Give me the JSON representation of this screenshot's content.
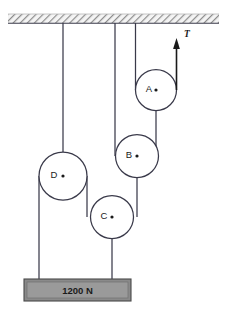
{
  "figure": {
    "type": "pulley-system-diagram",
    "background_color": "#ffffff",
    "line_color": "#3a3a4a",
    "label_color": "#1a1a1a"
  },
  "ceiling": {
    "name": "ceiling-support",
    "hatch_color": "#8d8d8d",
    "fill_color": "#f2f2f2",
    "x": 8,
    "y": 14,
    "width": 211,
    "height": 9
  },
  "pulleys": [
    {
      "id": "A",
      "label": "A",
      "cx": 156,
      "cy": 90,
      "r": 20.5,
      "label_dx": -7,
      "label_dy": -1,
      "fill": "#ffffff",
      "stroke": "#3a3a4a"
    },
    {
      "id": "B",
      "label": "B",
      "cx": 137,
      "cy": 156,
      "r": 21.5,
      "label_dx": -8,
      "label_dy": -1,
      "fill": "#ffffff",
      "stroke": "#3a3a4a"
    },
    {
      "id": "C",
      "label": "C",
      "cx": 112,
      "cy": 217,
      "r": 21.5,
      "label_dx": -8,
      "label_dy": -1,
      "fill": "#ffffff",
      "stroke": "#3a3a4a"
    },
    {
      "id": "D",
      "label": "D",
      "cx": 63,
      "cy": 176,
      "r": 24,
      "label_dx": -9,
      "label_dy": -1,
      "fill": "#ffffff",
      "stroke": "#3a3a4a"
    }
  ],
  "ropes": [
    {
      "name": "rope-ceiling-to-D-axle",
      "points": "63,23 63,176"
    },
    {
      "name": "rope-ceiling-to-B-left",
      "points": "115,23 115,156"
    },
    {
      "name": "rope-ceiling-to-A-left",
      "points": "135.5,23 135.5,90"
    },
    {
      "name": "rope-A-axle-to-B-right",
      "points": "156,90 156,156"
    },
    {
      "name": "rope-B-axle-to-C-right",
      "points": "137,156 137,217"
    },
    {
      "name": "rope-D-left-to-weight",
      "points": "39,176 39,279"
    },
    {
      "name": "rope-D-right-to-C-left",
      "points": "87,176 87,217"
    },
    {
      "name": "rope-C-axle-to-weight",
      "points": "112,217 112,279"
    }
  ],
  "tension_arrow": {
    "name": "tension-arrow-T",
    "label": "T",
    "x": 176.5,
    "y_tail": 90,
    "y_head": 38,
    "label_x": 187,
    "label_y": 35,
    "color": "#1a1a1a"
  },
  "weight_block": {
    "name": "weight-block",
    "label": "1200 N",
    "x": 24,
    "y": 279,
    "width": 107,
    "height": 22,
    "fill": "#8a8a8a",
    "inner_fill": "#9a9a9a",
    "stroke": "#4a4a4a",
    "label_x": 77.5,
    "label_y": 291
  }
}
